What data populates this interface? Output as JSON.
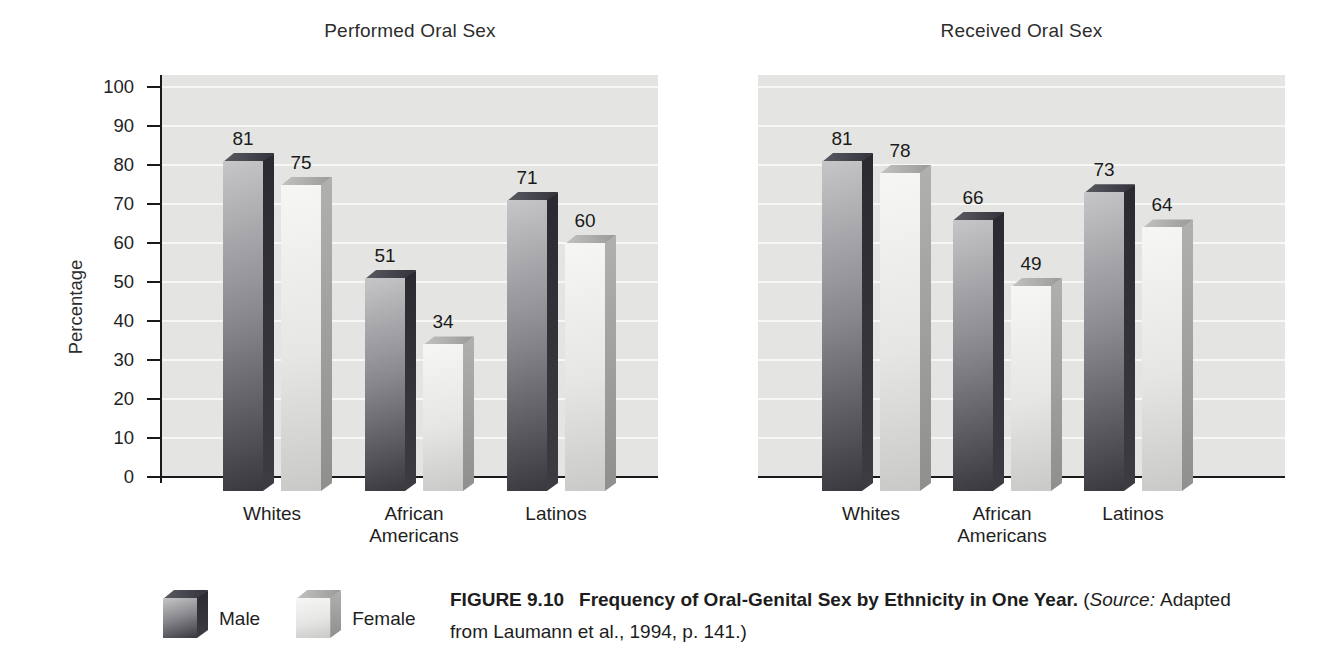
{
  "figure": {
    "caption": {
      "label": "FIGURE 9.10",
      "title": "Frequency of Oral-Genital Sex by Ethnicity in One Year.",
      "source_open": "(",
      "source_word": "Source:",
      "source_rest": "Adapted from Laumann et al., 1994, p. 141.)"
    }
  },
  "legend": {
    "items": [
      {
        "label": "Male"
      },
      {
        "label": "Female"
      }
    ]
  },
  "chart_data": [
    {
      "type": "bar",
      "style": "3d-grouped",
      "title": "Performed Oral Sex",
      "xlabel": "",
      "ylabel": "Percentage",
      "ylim": [
        0,
        100
      ],
      "yticks": [
        0,
        10,
        20,
        30,
        40,
        50,
        60,
        70,
        80,
        90,
        100
      ],
      "grid": "horizontal-white-lines",
      "bar_value_labels": true,
      "categories": [
        "Whites",
        "African\nAmericans",
        "Latinos"
      ],
      "series": [
        {
          "name": "Male",
          "values": [
            81,
            51,
            71
          ]
        },
        {
          "name": "Female",
          "values": [
            75,
            34,
            60
          ]
        }
      ]
    },
    {
      "type": "bar",
      "style": "3d-grouped",
      "title": "Received Oral Sex",
      "xlabel": "",
      "ylabel": "",
      "ylim": [
        0,
        100
      ],
      "yticks": [
        0,
        10,
        20,
        30,
        40,
        50,
        60,
        70,
        80,
        90,
        100
      ],
      "yticks_labeled": false,
      "grid": "horizontal-white-lines",
      "bar_value_labels": true,
      "categories": [
        "Whites",
        "African\nAmericans",
        "Latinos"
      ],
      "series": [
        {
          "name": "Male",
          "values": [
            81,
            66,
            73
          ]
        },
        {
          "name": "Female",
          "values": [
            78,
            49,
            64
          ]
        }
      ]
    }
  ],
  "colors": {
    "plot-bg": "#e4e4e2",
    "gridline": "#f7f7f5",
    "axis": "#1a1a1a",
    "text": "#1f1f1f",
    "male-front-light": "#c6c6c8",
    "male-front-dark": "#38383e",
    "male-side-top": "#2a2a30",
    "male-side-bottom": "#3c3c42",
    "male-top-light": "#5a5a62",
    "male-top-dark": "#33333b",
    "female-front-light": "#f6f6f4",
    "female-front-dark": "#c9c9c7",
    "female-side-top": "#b0b0ae",
    "female-side-bottom": "#8f8f8d",
    "female-top-light": "#c2c2c0",
    "female-top-dark": "#9a9a98"
  }
}
